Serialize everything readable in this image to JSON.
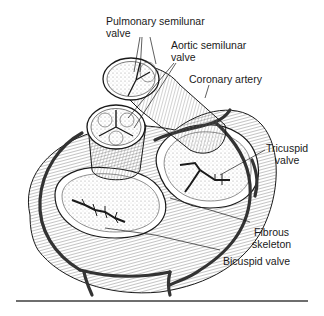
{
  "figure": {
    "labels": {
      "pulmonary": {
        "line1": "Pulmonary semilunar",
        "line2": "valve"
      },
      "aortic": {
        "line1": "Aortic semilunar",
        "line2": "valve"
      },
      "coronary": {
        "line1": "Coronary artery"
      },
      "tricuspid": {
        "line1": "Tricuspid",
        "line2": "valve"
      },
      "fibrous": {
        "line1": "Fibrous",
        "line2": "skeleton"
      },
      "bicuspid": {
        "line1": "Bicuspid valve"
      }
    },
    "colors": {
      "ink": "#1a1a1a",
      "hatch": "#555555",
      "artery": "#333333",
      "rule": "#6e6e6e",
      "background": "#ffffff"
    }
  }
}
